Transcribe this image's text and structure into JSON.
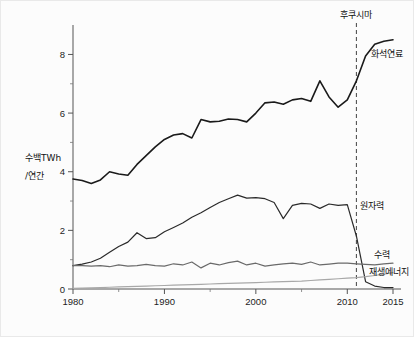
{
  "chart_data": {
    "type": "line",
    "title": "",
    "xlabel": "",
    "ylabel": "수백TWh\n/연간",
    "ylabel_line1": "수백TWh",
    "ylabel_line2": "/연간",
    "xlim": [
      1980,
      2015
    ],
    "ylim": [
      0,
      8.8
    ],
    "grid": false,
    "legend_position": "inline-right",
    "x_ticks": [
      "1980",
      "1990",
      "2000",
      "2010",
      "2015"
    ],
    "x_tick_values": [
      1980,
      1990,
      2000,
      2010,
      2015
    ],
    "y_ticks": [
      "0",
      "2",
      "4",
      "6",
      "8"
    ],
    "y_tick_values": [
      0,
      2,
      4,
      6,
      8
    ],
    "y_minor_ticks": [
      1,
      3,
      5,
      7
    ],
    "annotations": [
      {
        "name": "fukushima-event",
        "label": "후쿠시마",
        "x": 2011,
        "type": "vertical-dashed-line"
      }
    ],
    "x": [
      1980,
      1981,
      1982,
      1983,
      1984,
      1985,
      1986,
      1987,
      1988,
      1989,
      1990,
      1991,
      1992,
      1993,
      1994,
      1995,
      1996,
      1997,
      1998,
      1999,
      2000,
      2001,
      2002,
      2003,
      2004,
      2005,
      2006,
      2007,
      2008,
      2009,
      2010,
      2011,
      2012,
      2013,
      2014,
      2015
    ],
    "series": [
      {
        "name": "화석연료",
        "label": "화석연료",
        "color": "#1a1a1a",
        "width": 1.6,
        "values": [
          3.75,
          3.7,
          3.6,
          3.72,
          4.0,
          3.92,
          3.88,
          4.25,
          4.55,
          4.85,
          5.1,
          5.25,
          5.3,
          5.15,
          5.78,
          5.7,
          5.72,
          5.8,
          5.78,
          5.7,
          6.0,
          6.35,
          6.38,
          6.3,
          6.45,
          6.5,
          6.4,
          7.1,
          6.55,
          6.2,
          6.45,
          7.1,
          7.95,
          8.35,
          8.45,
          8.5
        ]
      },
      {
        "name": "원자력",
        "label": "원자력",
        "color": "#2a2a2a",
        "width": 1.2,
        "values": [
          0.8,
          0.85,
          0.92,
          1.05,
          1.25,
          1.45,
          1.6,
          1.92,
          1.72,
          1.75,
          1.95,
          2.1,
          2.25,
          2.45,
          2.6,
          2.78,
          2.95,
          3.08,
          3.2,
          3.1,
          3.12,
          3.08,
          2.95,
          2.4,
          2.85,
          2.92,
          2.9,
          2.75,
          2.9,
          2.85,
          2.88,
          1.8,
          0.25,
          0.1,
          0.05,
          0.05
        ]
      },
      {
        "name": "수력",
        "label": "수력",
        "color": "#6a6a6a",
        "width": 1.2,
        "values": [
          0.8,
          0.8,
          0.78,
          0.8,
          0.76,
          0.82,
          0.78,
          0.8,
          0.84,
          0.8,
          0.78,
          0.86,
          0.82,
          0.92,
          0.72,
          0.88,
          0.82,
          0.9,
          0.95,
          0.82,
          0.88,
          0.78,
          0.82,
          0.86,
          0.88,
          0.84,
          0.92,
          0.82,
          0.85,
          0.88,
          0.88,
          0.86,
          0.84,
          0.82,
          0.86,
          0.88
        ]
      },
      {
        "name": "재생에너지",
        "label": "재생에너지",
        "color": "#a8a8a8",
        "width": 1.2,
        "values": [
          0.02,
          0.03,
          0.04,
          0.05,
          0.06,
          0.07,
          0.08,
          0.09,
          0.1,
          0.11,
          0.12,
          0.13,
          0.14,
          0.15,
          0.16,
          0.17,
          0.18,
          0.19,
          0.2,
          0.21,
          0.22,
          0.23,
          0.24,
          0.25,
          0.26,
          0.27,
          0.29,
          0.31,
          0.33,
          0.35,
          0.37,
          0.39,
          0.42,
          0.46,
          0.51,
          0.56
        ]
      }
    ]
  }
}
